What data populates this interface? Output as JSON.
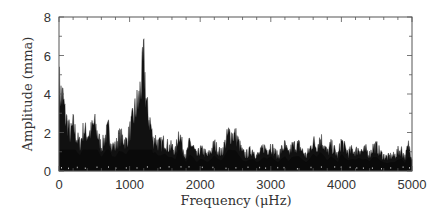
{
  "chart_data": {
    "type": "area",
    "title": "",
    "xlabel": "Frequency (μHz)",
    "ylabel": "Amplitude (mma)",
    "xlim": [
      0,
      5000
    ],
    "ylim": [
      0,
      8
    ],
    "x_ticks": [
      0,
      1000,
      2000,
      3000,
      4000,
      5000
    ],
    "x_tick_labels": [
      "0",
      "1000",
      "2000",
      "3000",
      "4000",
      "5000"
    ],
    "x_minor_tick_step": 200,
    "y_ticks": [
      0,
      2,
      4,
      6,
      8
    ],
    "y_tick_labels": [
      "0",
      "2",
      "4",
      "6",
      "8"
    ],
    "y_minor_tick_step": 1,
    "grid": false,
    "legend": null,
    "series": [
      {
        "name": "amplitude spectrum (upper envelope)",
        "color": "#111111",
        "x": [
          0,
          30,
          60,
          90,
          120,
          160,
          200,
          250,
          300,
          350,
          400,
          450,
          500,
          550,
          600,
          650,
          700,
          750,
          800,
          850,
          900,
          950,
          1000,
          1050,
          1100,
          1130,
          1160,
          1180,
          1200,
          1215,
          1230,
          1250,
          1270,
          1300,
          1330,
          1360,
          1400,
          1450,
          1500,
          1550,
          1600,
          1650,
          1700,
          1750,
          1800,
          1850,
          1900,
          1950,
          2000,
          2050,
          2100,
          2150,
          2200,
          2250,
          2300,
          2350,
          2400,
          2450,
          2500,
          2550,
          2600,
          2650,
          2700,
          2750,
          2800,
          2850,
          2900,
          2950,
          3000,
          3050,
          3100,
          3150,
          3200,
          3250,
          3300,
          3350,
          3400,
          3450,
          3500,
          3550,
          3600,
          3650,
          3700,
          3750,
          3800,
          3850,
          3900,
          3950,
          4000,
          4050,
          4100,
          4150,
          4200,
          4250,
          4300,
          4350,
          4400,
          4450,
          4500,
          4550,
          4600,
          4650,
          4700,
          4750,
          4800,
          4850,
          4900,
          4950,
          5000
        ],
        "values": [
          5.8,
          5.0,
          4.8,
          3.6,
          3.2,
          2.4,
          3.1,
          2.2,
          1.8,
          2.8,
          2.4,
          2.6,
          3.2,
          2.4,
          1.6,
          2.2,
          2.8,
          1.7,
          1.6,
          2.3,
          2.2,
          1.9,
          2.6,
          3.5,
          4.4,
          4.6,
          5.8,
          6.3,
          7.4,
          6.4,
          5.0,
          4.0,
          3.6,
          3.1,
          2.0,
          2.2,
          1.8,
          1.8,
          2.0,
          1.6,
          1.6,
          1.3,
          2.7,
          1.6,
          1.0,
          1.9,
          1.6,
          1.0,
          1.4,
          1.3,
          1.0,
          1.3,
          1.8,
          1.4,
          1.2,
          1.8,
          2.5,
          2.4,
          2.4,
          1.8,
          1.2,
          1.1,
          1.3,
          1.4,
          1.0,
          1.2,
          1.6,
          1.4,
          1.7,
          1.3,
          1.0,
          1.4,
          1.7,
          1.1,
          1.6,
          1.7,
          1.7,
          1.3,
          1.0,
          1.4,
          2.0,
          1.6,
          2.2,
          1.8,
          1.2,
          1.7,
          1.4,
          1.0,
          2.0,
          1.5,
          1.2,
          1.4,
          1.3,
          1.5,
          1.3,
          1.4,
          1.1,
          1.6,
          1.6,
          1.2,
          1.0,
          0.9,
          1.0,
          1.0,
          1.3,
          1.4,
          0.9,
          1.7,
          1.0
        ]
      }
    ],
    "annotations": []
  }
}
